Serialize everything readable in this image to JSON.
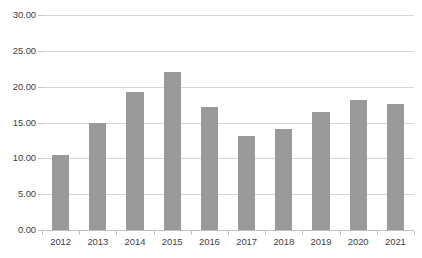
{
  "chart_data": {
    "type": "bar",
    "title": "",
    "subtitle": "",
    "xlabel": "",
    "ylabel": "",
    "categories": [
      "2012",
      "2013",
      "2014",
      "2015",
      "2016",
      "2017",
      "2018",
      "2019",
      "2020",
      "2021"
    ],
    "values": [
      10.4,
      14.9,
      19.3,
      22.1,
      17.1,
      13.1,
      14.1,
      16.4,
      18.1,
      17.6
    ],
    "ylim": [
      0,
      30
    ],
    "ytick_step": 5,
    "ytick_labels": [
      "0.00",
      "5.00",
      "10.00",
      "15.00",
      "20.00",
      "25.00",
      "30.00"
    ],
    "ytick_values": [
      0,
      5,
      10,
      15,
      20,
      25,
      30
    ],
    "grid": true,
    "grid_axis": "y",
    "legend": false,
    "legend_position": "none",
    "series": [
      {
        "name": "",
        "values": [
          10.4,
          14.9,
          19.3,
          22.1,
          17.1,
          13.1,
          14.1,
          16.4,
          18.1,
          17.6
        ]
      }
    ]
  },
  "style": {
    "bar_color": "#9a9a9a",
    "gridline_color": "#d4d4d4",
    "axis_color": "#c2c2c2",
    "tick_label_color": "#3f3f3f",
    "background": "#ffffff"
  }
}
